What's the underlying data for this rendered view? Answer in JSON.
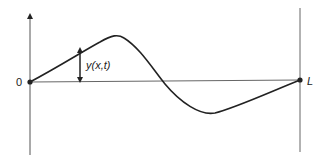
{
  "diagram": {
    "origin_label": "0",
    "end_label": "L",
    "displacement_label": "y(x,t)",
    "line_color": "#222222",
    "axis_color": "#555555"
  }
}
